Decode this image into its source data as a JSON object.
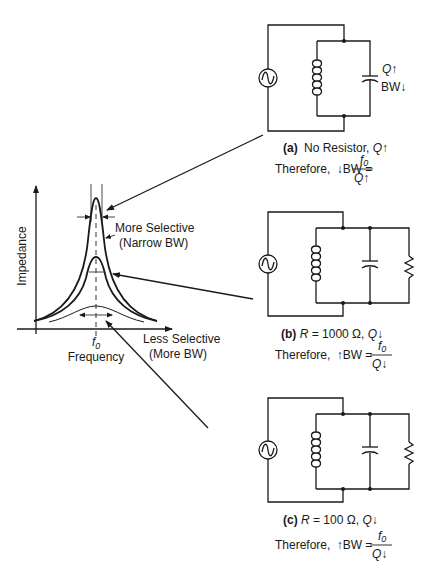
{
  "graph": {
    "y_axis_label": "Impedance",
    "x_axis_label": "Frequency",
    "center_freq_label": "f",
    "center_freq_sub": "0",
    "high_q_label_line1": "More Selective",
    "high_q_label_line2": "(Narrow BW)",
    "low_q_label_line1": "Less Selective",
    "low_q_label_line2": "(More  BW)"
  },
  "circuits": [
    {
      "id": "a",
      "tag": "(a)",
      "caption": "No Resistor,",
      "q_symbol": "Q",
      "q_dir": "up",
      "side_label_q": "Q",
      "side_label_bw": "BW",
      "therefore": "Therefore,",
      "bw_dir": "down",
      "bw_text": "BW =",
      "frac_num": "f",
      "frac_num_sub": "0",
      "frac_den": "Q",
      "has_resistor": false
    },
    {
      "id": "b",
      "tag": "(b)",
      "r_symbol": "R",
      "caption": "= 1000 Ω,",
      "q_symbol": "Q",
      "q_dir": "down",
      "therefore": "Therefore,",
      "bw_dir": "up",
      "bw_text": "BW =",
      "frac_num": "f",
      "frac_num_sub": "0",
      "frac_den": "Q",
      "has_resistor": true
    },
    {
      "id": "c",
      "tag": "(c)",
      "r_symbol": "R",
      "caption": "= 100 Ω,",
      "q_symbol": "Q",
      "q_dir": "down",
      "therefore": "Therefore,",
      "bw_dir": "up",
      "bw_text": "BW =",
      "frac_num": "f",
      "frac_num_sub": "0",
      "frac_den": "Q",
      "has_resistor": true
    }
  ],
  "arrows": {
    "up": "↑",
    "down": "↓"
  }
}
